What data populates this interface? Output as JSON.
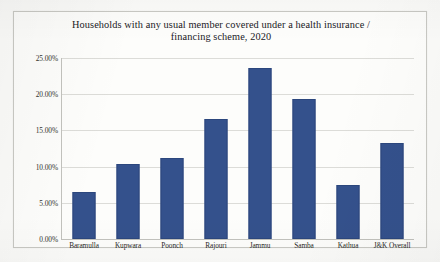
{
  "chart_data": {
    "type": "bar",
    "title": "Households with any usual member covered under a health insurance / financing scheme, 2020",
    "title_line1": "Households with any usual member covered under a health insurance /",
    "title_line2": "financing scheme, 2020",
    "xlabel": "",
    "ylabel": "",
    "ylim": [
      0,
      25
    ],
    "ytick_step": 5,
    "ytick_labels": [
      "25.00%",
      "20.00%",
      "15.00%",
      "10.00%",
      "5.00%",
      "0.00%"
    ],
    "ytick_values": [
      25,
      20,
      15,
      10,
      5,
      0
    ],
    "grid": true,
    "legend": false,
    "categories": [
      "Baramulla",
      "Kupwara",
      "Poonch",
      "Rajouri",
      "Jammu",
      "Samba",
      "Kathua",
      "J&K Overall"
    ],
    "values": [
      6.5,
      10.4,
      11.2,
      16.6,
      23.6,
      19.4,
      7.5,
      13.2
    ],
    "value_unit": "%",
    "series": [
      {
        "name": "Households covered",
        "values": [
          6.5,
          10.4,
          11.2,
          16.6,
          23.6,
          19.4,
          7.5,
          13.2
        ]
      }
    ],
    "colors": {
      "bar_fill": "#34518c",
      "bar_border": "#2c477d",
      "gridline": "#dcdcd8",
      "axis": "#c2c2bd",
      "text": "#20201e",
      "plot_background": "#fdfdfb",
      "page_background": "#fbfbf9",
      "frame_border": "#c9c9c4"
    }
  }
}
